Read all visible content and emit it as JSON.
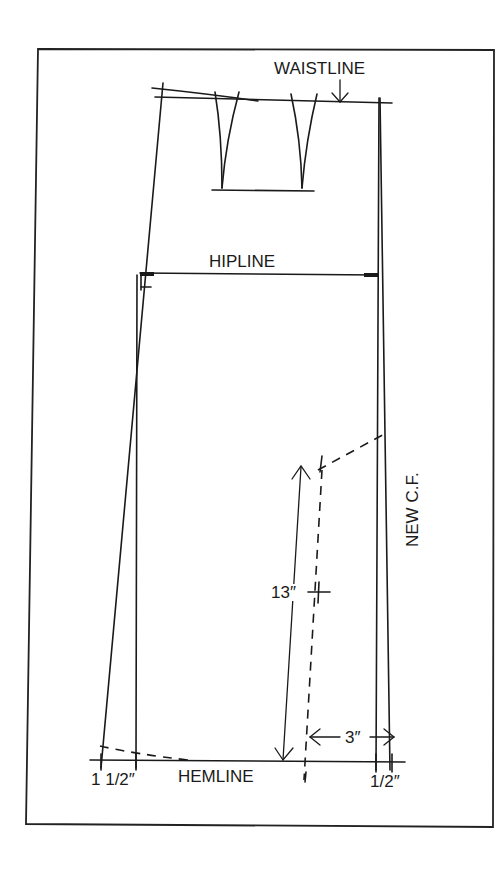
{
  "diagram": {
    "labels": {
      "waistline": "WAISTLINE",
      "hipline": "HIPLINE",
      "hemline": "HEMLINE",
      "new_cf": "NEW C.F.",
      "length_measure": "13″",
      "flare_measure": "3″",
      "left_extension": "1 1/2″",
      "right_extension": "1/2″"
    },
    "colors": {
      "ink": "#1a1a1a",
      "background": "#ffffff",
      "frame": "#222222"
    },
    "elements": [
      {
        "name": "frame",
        "kind": "rectangle"
      },
      {
        "name": "waistline",
        "kind": "line",
        "note": "with downward arrow from label"
      },
      {
        "name": "dart-left",
        "kind": "dart"
      },
      {
        "name": "dart-right",
        "kind": "dart"
      },
      {
        "name": "dart-base-line",
        "kind": "line"
      },
      {
        "name": "hipline",
        "kind": "line",
        "note": "squared corners at both sides"
      },
      {
        "name": "side-seam-original",
        "kind": "line"
      },
      {
        "name": "side-seam-extended",
        "kind": "line",
        "note": "extends 1 1/2 in at hem"
      },
      {
        "name": "center-front-original",
        "kind": "line"
      },
      {
        "name": "new-center-front",
        "kind": "line",
        "note": "extends 1/2 in at hem"
      },
      {
        "name": "slash-line",
        "kind": "dashed-line",
        "note": "3 in from CF, 13 in long"
      },
      {
        "name": "hem-curve-left",
        "kind": "dashed-line"
      },
      {
        "name": "hem-guide-right",
        "kind": "dashed-line"
      },
      {
        "name": "hemline",
        "kind": "line"
      }
    ]
  }
}
